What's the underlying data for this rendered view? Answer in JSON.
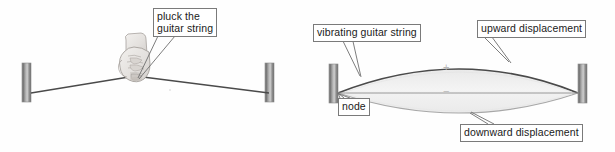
{
  "figure": {
    "background_color": "#fefefe",
    "width": 615,
    "height": 152
  },
  "colors": {
    "string_dark": "#4a4a4a",
    "string_light": "#9a9a9a",
    "lens_fill": "#efefef",
    "post_dark": "#6e6e6e",
    "post_light": "#cfcfcf",
    "label_border": "#7a7a7a",
    "label_text": "#1a1a1a",
    "leader_line": "#6e6e6e",
    "symbol_gray": "#b9b9b9"
  },
  "left_panel": {
    "name": "plucked-string-diagram",
    "label": {
      "id": "pluck",
      "line1": "pluck the",
      "line2": "guitar string"
    },
    "parts": {
      "left_post": "nut-post",
      "right_post": "bridge-post",
      "string": "plucked-string",
      "hand": "hand-plucking"
    }
  },
  "right_panel": {
    "name": "vibrating-string-diagram",
    "labels": {
      "vibrating": "vibrating guitar string",
      "upward": "upward displacement",
      "node": "node",
      "downward": "downward displacement"
    },
    "symbols": {
      "plus": "+",
      "minus": "−"
    },
    "parts": {
      "left_post": "nut-post",
      "right_post": "bridge-post",
      "upper_arc": "upward-displacement-arc",
      "lower_arc": "downward-displacement-arc",
      "rest_line": "string-rest-position-line",
      "envelope": "vibration-envelope"
    }
  }
}
